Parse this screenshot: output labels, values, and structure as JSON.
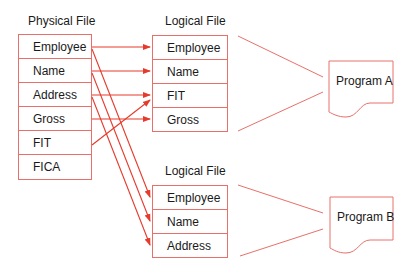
{
  "physical_file": {
    "title": "Physical File",
    "fields": [
      "Employee",
      "Name",
      "Address",
      "Gross",
      "FIT",
      "FICA"
    ]
  },
  "logical_file_a": {
    "title": "Logical File",
    "fields": [
      "Employee",
      "Name",
      "FIT",
      "Gross"
    ]
  },
  "logical_file_b": {
    "title": "Logical File",
    "fields": [
      "Employee",
      "Name",
      "Address"
    ]
  },
  "program_a": {
    "label": "Program A"
  },
  "program_b": {
    "label": "Program B"
  },
  "colors": {
    "box_border": "#e8706a",
    "arrow": "#e53a2c",
    "text": "#1a1a1a"
  },
  "mappings": [
    {
      "from": "Employee",
      "to": "Logical A Employee"
    },
    {
      "from": "Name",
      "to": "Logical A Name"
    },
    {
      "from": "Address",
      "to": "Logical A FIT row"
    },
    {
      "from": "Gross",
      "to": "Logical A Gross"
    },
    {
      "from": "FIT",
      "to": "Logical A FIT"
    },
    {
      "from": "Employee",
      "to": "Logical B Employee"
    },
    {
      "from": "Name",
      "to": "Logical B Name"
    },
    {
      "from": "Address",
      "to": "Logical B Address"
    }
  ]
}
